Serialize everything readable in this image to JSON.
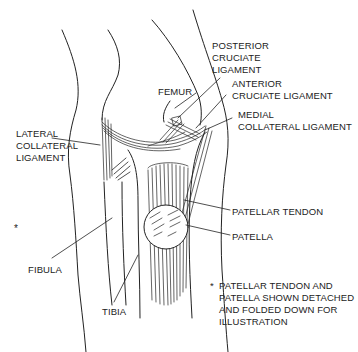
{
  "diagram": {
    "line_color": "#222222",
    "background": "#ffffff",
    "labels": [
      {
        "id": "posterior-cruciate-ligament",
        "lines": [
          "POSTERIOR",
          "CRUCIATE",
          "LIGAMENT"
        ]
      },
      {
        "id": "anterior-cruciate-ligament",
        "lines": [
          "ANTERIOR",
          "CRUCIATE LIGAMENT"
        ]
      },
      {
        "id": "femur",
        "lines": [
          "FEMUR"
        ]
      },
      {
        "id": "medial-collateral-ligament",
        "lines": [
          "MEDIAL",
          "COLLATERAL LIGAMENT"
        ]
      },
      {
        "id": "lateral-collateral-ligament",
        "lines": [
          "LATERAL",
          "COLLATERAL",
          "LIGAMENT"
        ]
      },
      {
        "id": "patellar-tendon",
        "lines": [
          "PATELLAR TENDON"
        ]
      },
      {
        "id": "patella",
        "lines": [
          "PATELLA"
        ]
      },
      {
        "id": "fibula",
        "lines": [
          "FIBULA"
        ]
      },
      {
        "id": "tibia",
        "lines": [
          "TIBIA"
        ]
      }
    ],
    "footnote": {
      "marker": "*",
      "lines": [
        "PATELLAR TENDON AND",
        "PATELLA SHOWN DETACHED",
        "AND FOLDED DOWN FOR",
        "ILLUSTRATION"
      ]
    }
  }
}
